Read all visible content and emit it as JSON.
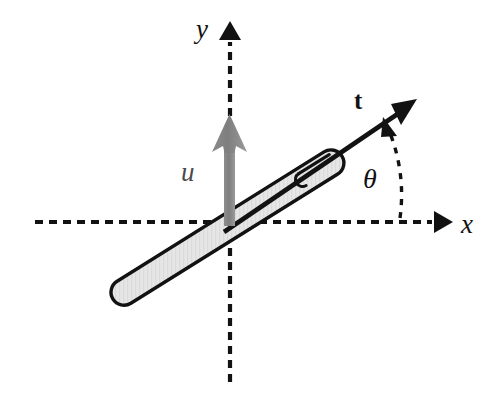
{
  "figure": {
    "kind": "vector-diagram",
    "background_color": "#ffffff",
    "width": 495,
    "height": 404
  },
  "colors": {
    "stroke": "#121212",
    "axis": "#121212",
    "u_vector": "#808080",
    "u_vector_dark": "#6f6f6f",
    "rod_fill": "#e2e2e2",
    "rod_outline": "#121212",
    "label": "#121212",
    "u_label": "#4a4a4a"
  },
  "axes": {
    "origin": {
      "x": 230,
      "y": 222
    },
    "x_axis": {
      "label": "x",
      "style": "dashed",
      "start": {
        "x": 35,
        "y": 222
      },
      "end": {
        "x": 434,
        "y": 222
      },
      "arrow_tip": {
        "x": 452,
        "y": 222
      },
      "label_position": {
        "x": 461,
        "y": 211
      }
    },
    "y_axis": {
      "label": "y",
      "style": "dashed",
      "start": {
        "x": 230,
        "y": 382
      },
      "end": {
        "x": 230,
        "y": 40
      },
      "arrow_tip": {
        "x": 230,
        "y": 21
      },
      "label_position": {
        "x": 196,
        "y": 16
      }
    }
  },
  "rod": {
    "name": "rod",
    "shape": "capsule",
    "fill": "#e2e2e2",
    "outline": "#121212",
    "angle_degrees": 32,
    "lower_end": {
      "x": 114,
      "y": 299
    },
    "upper_end": {
      "x": 347,
      "y": 153
    },
    "thickness": 26,
    "has_inner_slot_line": true
  },
  "vectors": [
    {
      "name": "t-vector",
      "label": "t",
      "label_style": "bold",
      "color": "#121212",
      "description": "tangent unit vector along rod axis",
      "start": {
        "x": 228,
        "y": 228
      },
      "tip": {
        "x": 416,
        "y": 100
      },
      "label_position": {
        "x": 354,
        "y": 88
      }
    },
    {
      "name": "u-vector",
      "label": "u",
      "label_style": "italic",
      "color": "#808080",
      "description": "vertical velocity/displacement vector at origin",
      "start": {
        "x": 230,
        "y": 224
      },
      "tip": {
        "x": 230,
        "y": 116
      },
      "label_position": {
        "x": 181,
        "y": 159
      }
    }
  ],
  "angle_marker": {
    "name": "theta-angle",
    "label": "θ",
    "label_style": "italic",
    "style": "dashed-arc-with-arrowhead",
    "from": {
      "x": 400,
      "y": 222
    },
    "to": {
      "x": 386,
      "y": 122
    },
    "arc_center": {
      "x": 230,
      "y": 222
    },
    "arc_radius": 170,
    "measures_from": "x-axis",
    "measures_to": "t-vector",
    "label_position": {
      "x": 363,
      "y": 165
    }
  },
  "labels": {
    "y_axis": "y",
    "x_axis": "x",
    "u_vector": "u",
    "t_vector": "t",
    "theta": "θ"
  }
}
